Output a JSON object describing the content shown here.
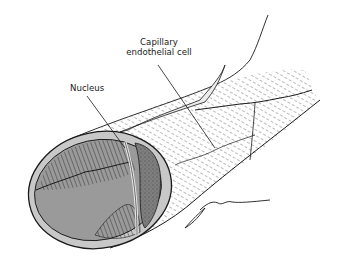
{
  "figure": {
    "labels": {
      "endothelial_cell_line1": "Capillary",
      "endothelial_cell_line2": "endothelial cell",
      "nucleus": "Nucleus"
    },
    "signature": "J. Brown",
    "colors": {
      "background": "#ffffff",
      "ink": "#1a1a1a",
      "wall_gray": "#c8c8c8",
      "lumen_gray": "#9a9a9a",
      "nucleus_gray": "#7e7e7e",
      "light_fill": "#e6e6e6"
    }
  }
}
